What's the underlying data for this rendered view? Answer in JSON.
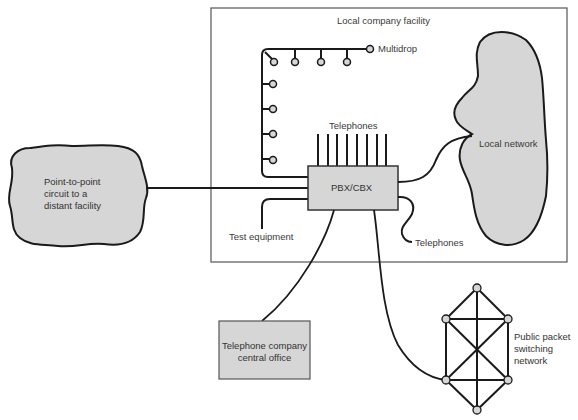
{
  "diagram": {
    "facility": {
      "label": "Local company facility"
    },
    "multidrop": {
      "label": "Multidrop"
    },
    "telephones_top": {
      "label": "Telephones"
    },
    "pbx": {
      "label": "PBX/CBX"
    },
    "test_equipment": {
      "label": "Test equipment"
    },
    "telephones_right": {
      "label": "Telephones"
    },
    "local_network": {
      "label": "Local network"
    },
    "point_to_point": {
      "line1": "Point-to-point",
      "line2": "circuit to a",
      "line3": "distant facility"
    },
    "central_office": {
      "line1": "Telephone company",
      "line2": "central office"
    },
    "packet_network": {
      "line1": "Public packet",
      "line2": "switching",
      "line3": "network"
    }
  },
  "colors": {
    "stroke": "#1a1a1a",
    "fill_gray": "#d6d6d6",
    "box_border": "#555555",
    "text": "#3a3a3a"
  }
}
